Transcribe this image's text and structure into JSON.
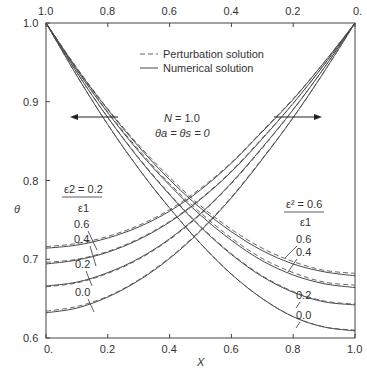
{
  "chart_data": {
    "type": "line",
    "title": "",
    "xlabel": "X",
    "ylabel": "θ",
    "xlim": [
      0.0,
      1.0
    ],
    "ylim": [
      0.6,
      1.0
    ],
    "x_ticks_bottom": [
      "0.",
      "0.2",
      "0.4",
      "0.6",
      "0.8",
      "1.0"
    ],
    "x_ticks_top": [
      "1.0",
      "0.8",
      "0.6",
      "0.4",
      "0.2",
      "0."
    ],
    "y_ticks": [
      "0.6",
      "0.7",
      "0.8",
      "0.9",
      "1.0"
    ],
    "grid": false,
    "legend": {
      "position": "upper center",
      "entries": [
        {
          "label": "Perturbation solution",
          "style": "dashed"
        },
        {
          "label": "Numerical solution",
          "style": "solid"
        }
      ]
    },
    "annotations": {
      "params_line1": "N = 1.0",
      "params_line2": "θa = θs = 0",
      "left_group_label_num": "ε2 = 0.2",
      "left_group_label_den": "ε1",
      "right_group_label_num": "ε² = 0.6",
      "right_group_label_den": "ε1",
      "left_arrow": "points left (read with top axis)",
      "right_arrow": "points right (read with bottom axis)"
    },
    "x": [
      0.0,
      0.1,
      0.2,
      0.3,
      0.4,
      0.5,
      0.6,
      0.7,
      0.8,
      0.9,
      1.0
    ],
    "series_left_family": {
      "description": "Curves with θ=1 at X=1 (bottom axis), decreasing toward X=0; parameter ε1 labels on left, ε2/ε1 = 0.2",
      "series": [
        {
          "name": "0.6 numerical",
          "style": "solid",
          "values": [
            0.714,
            0.718,
            0.727,
            0.741,
            0.761,
            0.788,
            0.822,
            0.862,
            0.903,
            0.95,
            1.0
          ]
        },
        {
          "name": "0.6 perturbation",
          "style": "dashed",
          "values": [
            0.716,
            0.72,
            0.729,
            0.743,
            0.763,
            0.79,
            0.823,
            0.863,
            0.904,
            0.95,
            1.0
          ]
        },
        {
          "name": "0.4 numerical",
          "style": "solid",
          "values": [
            0.694,
            0.699,
            0.709,
            0.725,
            0.747,
            0.776,
            0.811,
            0.853,
            0.898,
            0.947,
            1.0
          ]
        },
        {
          "name": "0.4 perturbation",
          "style": "dashed",
          "values": [
            0.696,
            0.7,
            0.71,
            0.726,
            0.748,
            0.777,
            0.812,
            0.854,
            0.898,
            0.947,
            1.0
          ]
        },
        {
          "name": "0.2 numerical",
          "style": "solid",
          "values": [
            0.666,
            0.671,
            0.683,
            0.701,
            0.726,
            0.758,
            0.797,
            0.842,
            0.89,
            0.943,
            1.0
          ]
        },
        {
          "name": "0.2 perturbation",
          "style": "dashed",
          "values": [
            0.665,
            0.67,
            0.682,
            0.7,
            0.725,
            0.757,
            0.796,
            0.841,
            0.89,
            0.943,
            1.0
          ]
        },
        {
          "name": "0.0 numerical",
          "style": "solid",
          "values": [
            0.632,
            0.638,
            0.652,
            0.673,
            0.701,
            0.736,
            0.778,
            0.827,
            0.88,
            0.938,
            1.0
          ]
        },
        {
          "name": "0.0 perturbation",
          "style": "dashed",
          "values": [
            0.634,
            0.64,
            0.653,
            0.674,
            0.702,
            0.737,
            0.779,
            0.828,
            0.88,
            0.938,
            1.0
          ]
        }
      ]
    },
    "series_right_family": {
      "description": "Curves with θ=1 at X=0, decreasing toward X=1; parameter ε1 labels on right, ε²/ε1 = 0.6",
      "series": [
        {
          "name": "0.6 numerical",
          "style": "solid",
          "values": [
            1.0,
            0.942,
            0.89,
            0.843,
            0.801,
            0.765,
            0.735,
            0.711,
            0.694,
            0.684,
            0.679
          ]
        },
        {
          "name": "0.6 perturbation",
          "style": "dashed",
          "values": [
            1.0,
            0.943,
            0.891,
            0.845,
            0.804,
            0.768,
            0.738,
            0.714,
            0.697,
            0.686,
            0.682
          ]
        },
        {
          "name": "0.4 numerical",
          "style": "solid",
          "values": [
            1.0,
            0.94,
            0.886,
            0.837,
            0.794,
            0.756,
            0.724,
            0.698,
            0.68,
            0.669,
            0.664
          ]
        },
        {
          "name": "0.4 perturbation",
          "style": "dashed",
          "values": [
            1.0,
            0.941,
            0.887,
            0.839,
            0.796,
            0.759,
            0.727,
            0.701,
            0.683,
            0.671,
            0.667
          ]
        },
        {
          "name": "0.2 numerical",
          "style": "solid",
          "values": [
            1.0,
            0.937,
            0.88,
            0.828,
            0.782,
            0.741,
            0.706,
            0.678,
            0.658,
            0.646,
            0.642
          ]
        },
        {
          "name": "0.2 perturbation",
          "style": "dashed",
          "values": [
            1.0,
            0.937,
            0.88,
            0.829,
            0.783,
            0.742,
            0.707,
            0.679,
            0.659,
            0.647,
            0.643
          ]
        },
        {
          "name": "0.0 numerical",
          "style": "solid",
          "values": [
            1.0,
            0.933,
            0.871,
            0.815,
            0.765,
            0.72,
            0.681,
            0.65,
            0.627,
            0.614,
            0.609
          ]
        },
        {
          "name": "0.0 perturbation",
          "style": "dashed",
          "values": [
            1.0,
            0.933,
            0.871,
            0.815,
            0.765,
            0.72,
            0.681,
            0.65,
            0.627,
            0.614,
            0.61
          ]
        }
      ]
    }
  },
  "labels": {
    "left_curve_labels": [
      "0.6",
      "0.4",
      "0.2",
      "0.0"
    ],
    "right_curve_labels": [
      "0.6",
      "0.4",
      "0.2",
      "0.0"
    ],
    "theta_axis": "θ",
    "x_axis": "X",
    "legend_dashed": "Perturbation solution",
    "legend_solid": "Numerical solution",
    "n_param": "N = 1.0",
    "theta_param": "θa = θs = 0",
    "left_frac_num": "ε2 = 0.2",
    "left_frac_den": "ε1",
    "right_frac_num": "ε² = 0.6",
    "right_frac_den": "ε1"
  }
}
